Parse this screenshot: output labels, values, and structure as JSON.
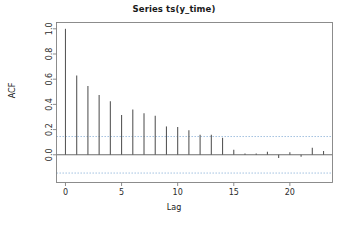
{
  "chart_data": {
    "type": "bar",
    "title": "Series ts(y_time)",
    "xlabel": "Lag",
    "ylabel": "ACF",
    "x": [
      0,
      1,
      2,
      3,
      4,
      5,
      6,
      7,
      8,
      9,
      10,
      11,
      12,
      13,
      14,
      15,
      16,
      17,
      18,
      19,
      20,
      21,
      22,
      23
    ],
    "values": [
      1.0,
      0.63,
      0.545,
      0.475,
      0.425,
      0.315,
      0.36,
      0.33,
      0.31,
      0.225,
      0.22,
      0.195,
      0.16,
      0.16,
      0.135,
      0.04,
      0.01,
      0.01,
      0.025,
      -0.025,
      0.02,
      -0.015,
      0.055,
      0.03
    ],
    "categories": [
      "0",
      "1",
      "2",
      "3",
      "4",
      "5",
      "6",
      "7",
      "8",
      "9",
      "10",
      "11",
      "12",
      "13",
      "14",
      "15",
      "16",
      "17",
      "18",
      "19",
      "20",
      "21",
      "22",
      "23"
    ],
    "series": [
      {
        "name": "ACF",
        "values": [
          1.0,
          0.63,
          0.545,
          0.475,
          0.425,
          0.315,
          0.36,
          0.33,
          0.31,
          0.225,
          0.22,
          0.195,
          0.16,
          0.16,
          0.135,
          0.04,
          0.01,
          0.01,
          0.025,
          -0.025,
          0.02,
          -0.015,
          0.055,
          0.03
        ]
      }
    ],
    "xlim": [
      -0.8,
      23.8
    ],
    "ylim": [
      -0.22,
      1.05
    ],
    "xticks": [
      0,
      5,
      10,
      15,
      20
    ],
    "xticklabels": [
      "0",
      "5",
      "10",
      "15",
      "20"
    ],
    "yticks": [
      0.0,
      0.2,
      0.4,
      0.6,
      0.8,
      1.0
    ],
    "yticklabels": [
      "0.0",
      "0.2",
      "0.4",
      "0.6",
      "0.8",
      "1.0"
    ],
    "grid": false,
    "legend": null,
    "confidence_interval": {
      "upper": 0.145,
      "lower": -0.145,
      "style": "dashed",
      "color": "#7fa9d0"
    },
    "zero_line": 0.0,
    "colors": {
      "spike": "#595959",
      "axis": "#808080",
      "ci": "#8fb4d9",
      "zero": "#6e6e6e",
      "text": "#1a1a1a",
      "background": "#ffffff"
    }
  }
}
